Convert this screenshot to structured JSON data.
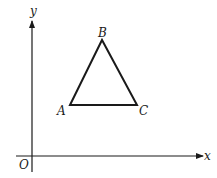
{
  "diagram": {
    "type": "coordinate-plane-triangle",
    "axes": {
      "x_label": "x",
      "y_label": "y",
      "origin_label": "O"
    },
    "triangle": {
      "vertices": [
        {
          "label": "A",
          "x": 70,
          "y": 105
        },
        {
          "label": "B",
          "x": 102,
          "y": 40
        },
        {
          "label": "C",
          "x": 137,
          "y": 105
        }
      ]
    },
    "colors": {
      "stroke": "#1a1a1a",
      "background": "#ffffff"
    }
  }
}
